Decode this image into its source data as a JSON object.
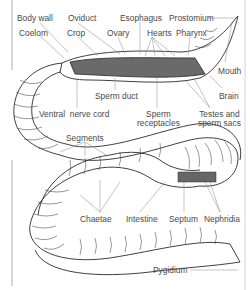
{
  "diagram": {
    "labels": [
      {
        "id": "body-wall",
        "text": "Body wall",
        "x": 17,
        "y": 14
      },
      {
        "id": "oviduct",
        "text": "Oviduct",
        "x": 68,
        "y": 14
      },
      {
        "id": "esophagus",
        "text": "Esophagus",
        "x": 120,
        "y": 14
      },
      {
        "id": "prostomium",
        "text": "Prostomium",
        "x": 169,
        "y": 14
      },
      {
        "id": "coelom",
        "text": "Coelom",
        "x": 19,
        "y": 29
      },
      {
        "id": "crop",
        "text": "Crop",
        "x": 67,
        "y": 29
      },
      {
        "id": "ovary",
        "text": "Ovary",
        "x": 107,
        "y": 29
      },
      {
        "id": "hearts",
        "text": "Hearts",
        "x": 147,
        "y": 29
      },
      {
        "id": "pharynx",
        "text": "Pharynx",
        "x": 176,
        "y": 29
      },
      {
        "id": "mouth",
        "text": "Mouth",
        "x": 218,
        "y": 67
      },
      {
        "id": "sperm-duct",
        "text": "Sperm duct",
        "x": 95,
        "y": 92
      },
      {
        "id": "brain",
        "text": "Brain",
        "x": 219,
        "y": 92
      },
      {
        "id": "ventral-nerve-cord",
        "text": "Ventral  nerve cord",
        "x": 39,
        "y": 110
      },
      {
        "id": "sperm-receptacles",
        "text": "Sperm\nreceptacles",
        "x": 137,
        "y": 110
      },
      {
        "id": "testes-sperm-sacs",
        "text": "Testes and\nsperm sacs",
        "x": 198,
        "y": 110
      },
      {
        "id": "segments",
        "text": "Segments",
        "x": 66,
        "y": 134
      },
      {
        "id": "chaetae",
        "text": "Chaetae",
        "x": 80,
        "y": 215
      },
      {
        "id": "intestine",
        "text": "Intestine",
        "x": 126,
        "y": 215
      },
      {
        "id": "septum",
        "text": "Septum",
        "x": 169,
        "y": 215
      },
      {
        "id": "nephridia",
        "text": "Nephridia",
        "x": 204,
        "y": 215
      },
      {
        "id": "pygidium",
        "text": "Pygidium",
        "x": 153,
        "y": 266
      }
    ],
    "colors": {
      "outline": "#2a2a2a",
      "label": "#4a4a4a",
      "leader": "#888888",
      "frame": "#9a9a9a",
      "internal": "#555555"
    }
  }
}
